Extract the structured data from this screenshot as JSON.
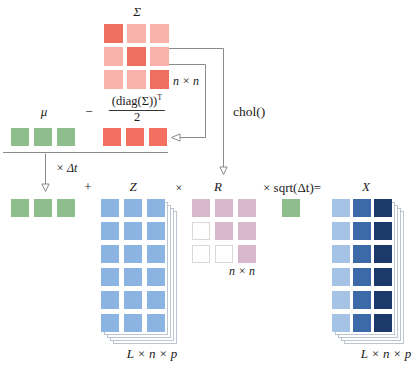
{
  "colors": {
    "sigmaDiag": "#ee6f5e",
    "sigmaOff": "#f8b2aa",
    "red": "#f37061",
    "green": "#8ebe8c",
    "zBlue": "#8bb4e3",
    "pink": "#d8b7cc",
    "xLight": "#a5c3e5",
    "xMid": "#3c69a7",
    "xDark": "#1b3a6b",
    "line": "#8a8a8a",
    "sheetBorder": "#bcc6d2",
    "emptyCellBorder": "#d9d9d9"
  },
  "labels": {
    "sigma": "Σ",
    "n_by_n_top": "n × n",
    "mu": "μ",
    "minus": "−",
    "numerator": "(diag(Σ))",
    "numerator_sup": "T",
    "denominator": "2",
    "chol": "chol()",
    "times_dt": "× Δt",
    "plus": "+",
    "z": "Z",
    "times": "×",
    "r": "R",
    "times_sqrt": "× sqrt(Δt)=",
    "x": "X",
    "l_n_p_z": "L × n × p",
    "n_by_n_r": "n × n",
    "l_n_p_x": "L × n × p"
  },
  "matrices": {
    "sigma": {
      "cells": [
        [
          "sigmaDiag",
          "sigmaOff",
          "sigmaOff"
        ],
        [
          "sigmaOff",
          "sigmaDiag",
          "sigmaOff"
        ],
        [
          "sigmaOff",
          "sigmaOff",
          "sigmaDiag"
        ]
      ]
    },
    "mu_row": {
      "cells": [
        [
          "green",
          "green",
          "green"
        ]
      ]
    },
    "diag_row": {
      "cells": [
        [
          "red",
          "red",
          "red"
        ]
      ]
    },
    "drift_row": {
      "cells": [
        [
          "green",
          "green",
          "green"
        ]
      ]
    },
    "z": {
      "cells": [
        [
          "zBlue",
          "zBlue",
          "zBlue"
        ],
        [
          "zBlue",
          "zBlue",
          "zBlue"
        ],
        [
          "zBlue",
          "zBlue",
          "zBlue"
        ],
        [
          "zBlue",
          "zBlue",
          "zBlue"
        ],
        [
          "zBlue",
          "zBlue",
          "zBlue"
        ],
        [
          "zBlue",
          "zBlue",
          "zBlue"
        ]
      ]
    },
    "r": {
      "cells": [
        [
          "pink",
          "pink",
          "pink"
        ],
        [
          "white",
          "pink",
          "pink"
        ],
        [
          "white",
          "white",
          "pink"
        ]
      ]
    },
    "sqrt_cell": {
      "cells": [
        [
          "green"
        ]
      ]
    },
    "x": {
      "cells": [
        [
          "xLight",
          "xMid",
          "xDark"
        ],
        [
          "xLight",
          "xMid",
          "xDark"
        ],
        [
          "xLight",
          "xMid",
          "xDark"
        ],
        [
          "xLight",
          "xMid",
          "xDark"
        ],
        [
          "xLight",
          "xMid",
          "xDark"
        ],
        [
          "xLight",
          "xMid",
          "xDark"
        ]
      ]
    }
  }
}
